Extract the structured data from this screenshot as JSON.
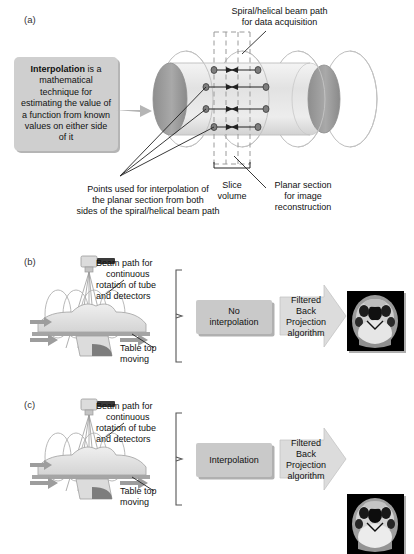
{
  "figure": {
    "panels": [
      {
        "id": "a",
        "label": "(a)",
        "callout_prefix": "Interpolation",
        "callout_rest": " is a mathematical technique for estimating the value of a function from known values on either side of it",
        "labels": {
          "beam_path": "Spiral/helical beam path\nfor data acquisition",
          "beam_path_l1": "Spiral/helical beam path",
          "beam_path_l2": "for data acquisition",
          "points_l1": "Points used for interpolation of",
          "points_l2": "the planar section from both",
          "points_l3": "sides of the spiral/helical beam path",
          "slice_l1": "Slice",
          "slice_l2": "volume",
          "planar_l1": "Planar section",
          "planar_l2": "for image",
          "planar_l3": "reconstruction"
        },
        "interpolation_rows": 4,
        "helix_loops": 4
      },
      {
        "id": "b",
        "label": "(b)",
        "beam_l1": "Beam path for",
        "beam_l2": "continuous",
        "beam_l3": "rotation of tube",
        "beam_l4": "and detectors",
        "table_l1": "Table top",
        "table_l2": "moving",
        "process_l1": "No",
        "process_l2": "interpolation",
        "algorithm_l1": "Filtered Back",
        "algorithm_l2": "Projection",
        "algorithm_l3": "algorithm",
        "result_alt": "axial CT head image with streak artefact"
      },
      {
        "id": "c",
        "label": "(c)",
        "beam_l1": "Beam path for",
        "beam_l2": "continuous",
        "beam_l3": "rotation of tube",
        "beam_l4": "and detectors",
        "table_l1": "Table top",
        "table_l2": "moving",
        "process_l1": "Interpolation",
        "process_l2": "",
        "algorithm_l1": "Filtered Back",
        "algorithm_l2": "Projection",
        "algorithm_l3": "algorithm",
        "result_alt": "axial CT head image, smooth"
      }
    ],
    "colors": {
      "callout_bg": "#cfcfcf",
      "box_bg": "#c9c9c9",
      "arrow_fill": "#d8d8d8",
      "cylinder_body": "#e8e8e8",
      "cylinder_cap": "#9a9a9a",
      "helix_stroke": "#b9b9b9",
      "line": "#222222",
      "motion_arrow": "#9d9d9d",
      "ct_bg": "#000000"
    }
  }
}
